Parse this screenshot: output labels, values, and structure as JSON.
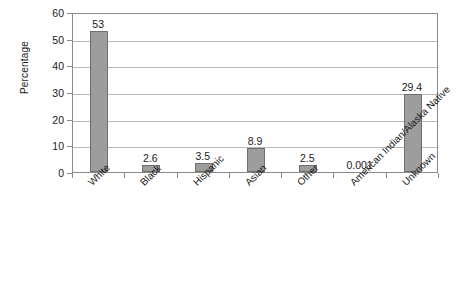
{
  "chart_data": {
    "type": "bar",
    "title": "",
    "xlabel": "",
    "ylabel": "Percentage",
    "categories": [
      "White",
      "Black",
      "Hispanic",
      "Asian",
      "Other",
      "American Indian/Alaska Native",
      "Unknown"
    ],
    "values": [
      53,
      2.6,
      3.5,
      8.9,
      2.5,
      0.001,
      29.4
    ],
    "value_labels": [
      "53",
      "2.6",
      "3.5",
      "8.9",
      "2.5",
      "0.001",
      "29.4"
    ],
    "ylim": [
      0,
      60
    ],
    "ytick_values": [
      0,
      10,
      20,
      30,
      40,
      50,
      60
    ],
    "ytick_labels": [
      "0",
      "10",
      "20",
      "30",
      "40",
      "50",
      "60"
    ],
    "grid": true,
    "grid_axis": "y",
    "legend": false,
    "legend_position": "none",
    "bar_color": "#9d9d9d",
    "bar_edge_color": "#6f6f6f",
    "gridline_color": "#b8b8b8",
    "axis_color": "#8a8a8a",
    "text_color": "#1a1a1a",
    "xtick_label_rotation": -45,
    "data_labels_shown": true
  }
}
